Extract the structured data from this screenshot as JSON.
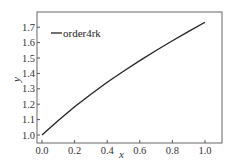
{
  "chart_data": {
    "type": "line",
    "title": "",
    "xlabel": "x",
    "ylabel": "y",
    "xlim": [
      -0.03,
      1.1
    ],
    "ylim": [
      0.95,
      1.78
    ],
    "grid": false,
    "legend_position": "upper left",
    "x_ticks": [
      "0.0",
      "0.2",
      "0.4",
      "0.6",
      "0.8",
      "1.0"
    ],
    "y_ticks": [
      "1.0",
      "1.1",
      "1.2",
      "1.3",
      "1.4",
      "1.5",
      "1.6",
      "1.7"
    ],
    "x": [
      0.0,
      0.1,
      0.2,
      0.3,
      0.4,
      0.5,
      0.6,
      0.7,
      0.8,
      0.9,
      1.0
    ],
    "series": [
      {
        "name": "order4rk",
        "color": "#222222",
        "values": [
          1.0,
          1.095,
          1.183,
          1.265,
          1.342,
          1.414,
          1.483,
          1.549,
          1.612,
          1.673,
          1.732
        ]
      }
    ]
  },
  "colors": {
    "axis": "#555555",
    "line": "#222222",
    "background": "#ffffff"
  }
}
